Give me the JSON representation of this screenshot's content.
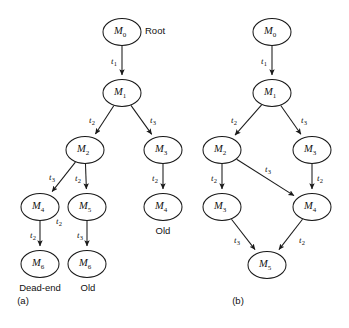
{
  "figure": {
    "background_color": "#ffffff",
    "stroke_color": "#1a1a1a",
    "text_color": "#111111"
  },
  "chart_data": {
    "type": "diagram",
    "title": "",
    "subdiagrams": [
      {
        "id": "a",
        "caption": "(a)",
        "kind": "reachability-tree",
        "nodes": [
          {
            "id": "a-m0",
            "base": "M",
            "sub": "0",
            "cx": 122,
            "cy": 32
          },
          {
            "id": "a-m1",
            "base": "M",
            "sub": "1",
            "cx": 122,
            "cy": 93
          },
          {
            "id": "a-m2",
            "base": "M",
            "sub": "2",
            "cx": 85,
            "cy": 150
          },
          {
            "id": "a-m3",
            "base": "M",
            "sub": "3",
            "cx": 163,
            "cy": 150
          },
          {
            "id": "a-m4",
            "base": "M",
            "sub": "4",
            "cx": 40,
            "cy": 207
          },
          {
            "id": "a-m5",
            "base": "M",
            "sub": "5",
            "cx": 87,
            "cy": 207
          },
          {
            "id": "a-m4b",
            "base": "M",
            "sub": "4",
            "cx": 163,
            "cy": 207
          },
          {
            "id": "a-m6",
            "base": "M",
            "sub": "6",
            "cx": 40,
            "cy": 264
          },
          {
            "id": "a-m6b",
            "base": "M",
            "sub": "6",
            "cx": 87,
            "cy": 264
          }
        ],
        "edges": [
          {
            "from": "a-m0",
            "to": "a-m1",
            "base": "t",
            "sub": "1",
            "lx": 114,
            "ly": 62
          },
          {
            "from": "a-m1",
            "to": "a-m2",
            "base": "t",
            "sub": "2",
            "lx": 92,
            "ly": 121
          },
          {
            "from": "a-m1",
            "to": "a-m3",
            "base": "t",
            "sub": "3",
            "lx": 153,
            "ly": 121
          },
          {
            "from": "a-m2",
            "to": "a-m4",
            "base": "t",
            "sub": "3",
            "lx": 52,
            "ly": 178
          },
          {
            "from": "a-m2",
            "to": "a-m5",
            "base": "t",
            "sub": "2",
            "lx": 78,
            "ly": 179
          },
          {
            "from": "a-m3",
            "to": "a-m4b",
            "base": "t",
            "sub": "2",
            "lx": 155,
            "ly": 179
          },
          {
            "from": "a-m4",
            "to": "a-m6",
            "base": "t",
            "sub": "2",
            "lx": 33,
            "ly": 236
          },
          {
            "from": "a-m5",
            "to": "a-m6b",
            "base": "t",
            "sub": "3",
            "lx": 80,
            "ly": 236
          }
        ],
        "stray_labels": [
          {
            "base": "t",
            "sub": "2",
            "lx": 59,
            "ly": 222
          }
        ],
        "annotations": [
          {
            "text": "Root",
            "x": 145,
            "y": 31,
            "anchor": "start"
          },
          {
            "text": "Dead-end",
            "x": 40,
            "y": 288,
            "anchor": "middle"
          },
          {
            "text": "Old",
            "x": 88,
            "y": 288,
            "anchor": "middle"
          },
          {
            "text": "Old",
            "x": 163,
            "y": 231,
            "anchor": "middle"
          }
        ],
        "caption_pos": {
          "x": 23,
          "y": 301
        }
      },
      {
        "id": "b",
        "caption": "(b)",
        "kind": "reachability-graph",
        "nodes": [
          {
            "id": "b-m0",
            "base": "M",
            "sub": "0",
            "cx": 272,
            "cy": 32
          },
          {
            "id": "b-m1",
            "base": "M",
            "sub": "1",
            "cx": 272,
            "cy": 93
          },
          {
            "id": "b-m2",
            "base": "M",
            "sub": "2",
            "cx": 222,
            "cy": 150
          },
          {
            "id": "b-m3",
            "base": "M",
            "sub": "3",
            "cx": 312,
            "cy": 150
          },
          {
            "id": "b-m3b",
            "base": "M",
            "sub": "3",
            "cx": 222,
            "cy": 207
          },
          {
            "id": "b-m4",
            "base": "M",
            "sub": "4",
            "cx": 312,
            "cy": 207
          },
          {
            "id": "b-m5",
            "base": "M",
            "sub": "5",
            "cx": 267,
            "cy": 265
          }
        ],
        "edges": [
          {
            "from": "b-m0",
            "to": "b-m1",
            "base": "t",
            "sub": "1",
            "lx": 264,
            "ly": 62
          },
          {
            "from": "b-m1",
            "to": "b-m2",
            "base": "t",
            "sub": "2",
            "lx": 234,
            "ly": 121
          },
          {
            "from": "b-m1",
            "to": "b-m3",
            "base": "t",
            "sub": "3",
            "lx": 304,
            "ly": 121
          },
          {
            "from": "b-m2",
            "to": "b-m3b",
            "base": "t",
            "sub": "2",
            "lx": 214,
            "ly": 179
          },
          {
            "from": "b-m2",
            "to": "b-m4",
            "base": "t",
            "sub": "3",
            "lx": 268,
            "ly": 170
          },
          {
            "from": "b-m3",
            "to": "b-m4",
            "base": "t",
            "sub": "2",
            "lx": 320,
            "ly": 179
          },
          {
            "from": "b-m3b",
            "to": "b-m5",
            "base": "t",
            "sub": "3",
            "lx": 237,
            "ly": 241
          },
          {
            "from": "b-m4",
            "to": "b-m5",
            "base": "t",
            "sub": "2",
            "lx": 302,
            "ly": 241
          }
        ],
        "stray_labels": [],
        "annotations": [],
        "caption_pos": {
          "x": 238,
          "y": 301
        }
      }
    ],
    "node_rx": 19,
    "node_ry": 13.5
  }
}
